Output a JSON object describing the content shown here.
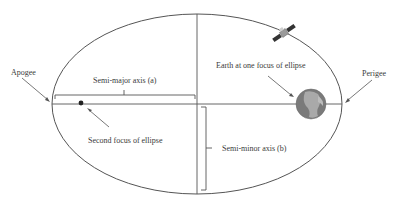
{
  "diagram": {
    "labels": {
      "apogee": "Apogee",
      "perigee": "Perigee",
      "semi_major": "Semi-major axis (a)",
      "semi_minor": "Semi-minor axis (b)",
      "earth_focus": "Earth at one focus of ellipse",
      "second_focus": "Second focus of ellipse"
    },
    "colors": {
      "line": "#555555",
      "text": "#3a3a3a",
      "earth_dark": "#6f6f6f",
      "earth_light": "#a9a9a9",
      "focus_dot": "#222222"
    },
    "icons": {
      "satellite": "satellite-icon",
      "earth": "earth-icon"
    }
  }
}
